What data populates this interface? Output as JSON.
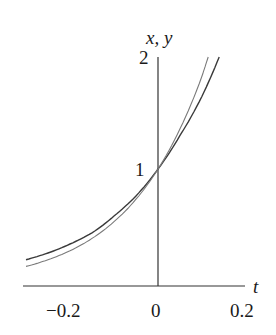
{
  "chart_data": {
    "type": "line",
    "title": "",
    "xlabel": "t",
    "ylabel": "x, y",
    "xlim": [
      -0.31,
      0.2
    ],
    "ylim": [
      0,
      2
    ],
    "x_ticks": [
      "-0.2",
      "0",
      "0.2"
    ],
    "y_ticks": [
      "1",
      "2"
    ],
    "grid": false,
    "legend": null,
    "series": [
      {
        "name": "x",
        "style": "dark",
        "x": [
          -0.3,
          -0.25,
          -0.2,
          -0.15,
          -0.1,
          -0.05,
          0.0,
          0.05,
          0.1,
          0.139
        ],
        "y": [
          0.19,
          0.25,
          0.33,
          0.43,
          0.58,
          0.76,
          1.0,
          1.3,
          1.65,
          2.0
        ]
      },
      {
        "name": "y",
        "style": "light",
        "x": [
          -0.3,
          -0.25,
          -0.2,
          -0.15,
          -0.1,
          -0.05,
          0.0,
          0.05,
          0.1,
          0.114
        ],
        "y": [
          0.13,
          0.19,
          0.27,
          0.38,
          0.53,
          0.73,
          1.0,
          1.36,
          1.83,
          2.0
        ]
      }
    ]
  },
  "labels": {
    "xlabel": "t",
    "ylabel": "x, y",
    "tick_x_neg": "−0.2",
    "tick_x_zero": "0",
    "tick_x_pos": "0.2",
    "tick_y_one": "1",
    "tick_y_two": "2"
  },
  "colors": {
    "axis": "#333333",
    "dark_curve": "#3a3a3a",
    "light_curve": "#7a7a7a"
  }
}
